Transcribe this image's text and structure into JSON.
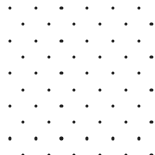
{
  "canvas": {
    "width": 155,
    "height": 155,
    "background_color": "#ffffff",
    "description": "seamless staggered polka dot pattern"
  },
  "pattern": {
    "type": "polka-dot-half-drop",
    "dot_color": "#1c1c1c",
    "dot_diameter": 3.2,
    "column_spacing": 25.7,
    "row_spacing": 16.3,
    "first_column_x": 10,
    "first_row_y": 8,
    "odd_row_offset_x": 12.85,
    "row_count": 10,
    "dots_per_even_row": 7,
    "dots_per_odd_row": 6,
    "total_dots": 65
  },
  "rows": [
    {
      "index": 0,
      "y": 8,
      "offset": false,
      "cx": [
        10,
        35.7,
        61.4,
        87.1,
        112.8,
        138.5
      ]
    },
    {
      "index": 1,
      "y": 24.3,
      "offset": true,
      "cx": [
        22.85,
        48.55,
        74.25,
        99.95,
        125.65,
        151.35
      ]
    },
    {
      "index": 2,
      "y": 40.6,
      "offset": false,
      "cx": [
        10,
        35.7,
        61.4,
        87.1,
        112.8,
        138.5
      ]
    },
    {
      "index": 3,
      "y": 56.9,
      "offset": true,
      "cx": [
        22.85,
        48.55,
        74.25,
        99.95,
        125.65,
        151.35
      ]
    },
    {
      "index": 4,
      "y": 73.2,
      "offset": false,
      "cx": [
        10,
        35.7,
        61.4,
        87.1,
        112.8,
        138.5
      ]
    },
    {
      "index": 5,
      "y": 89.5,
      "offset": true,
      "cx": [
        22.85,
        48.55,
        74.25,
        99.95,
        125.65,
        151.35
      ]
    },
    {
      "index": 6,
      "y": 105.8,
      "offset": false,
      "cx": [
        10,
        35.7,
        61.4,
        87.1,
        112.8,
        138.5
      ]
    },
    {
      "index": 7,
      "y": 122.1,
      "offset": true,
      "cx": [
        22.85,
        48.55,
        74.25,
        99.95,
        125.65,
        151.35
      ]
    },
    {
      "index": 8,
      "y": 138.4,
      "offset": false,
      "cx": [
        10,
        35.7,
        61.4,
        87.1,
        112.8,
        138.5
      ]
    },
    {
      "index": 9,
      "y": 154.7,
      "offset": true,
      "cx": [
        22.85,
        48.55,
        74.25,
        99.95,
        125.65,
        151.35
      ]
    }
  ]
}
